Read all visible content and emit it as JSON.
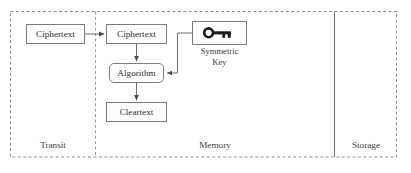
{
  "diagram": {
    "colors": {
      "background": "#ffffff",
      "zone_border": "#8e8e8e",
      "node_border": "#7a7a7a",
      "connector": "#6e6e6e",
      "text": "#2b2b2b",
      "key_glyph": "#1a1a1a"
    },
    "zones": [
      {
        "id": "transit",
        "label": "Transit",
        "divider_style": "dashed"
      },
      {
        "id": "memory",
        "label": "Memory",
        "divider_style": "solid"
      },
      {
        "id": "storage",
        "label": "Storage",
        "divider_style": "none"
      }
    ],
    "nodes": [
      {
        "id": "ciphertext-transit",
        "label": "Ciphertext",
        "shape": "rectangle",
        "zone": "transit"
      },
      {
        "id": "ciphertext-memory",
        "label": "Ciphertext",
        "shape": "rectangle",
        "zone": "memory"
      },
      {
        "id": "algorithm",
        "label": "Algorithm",
        "shape": "rounded-rectangle",
        "zone": "memory"
      },
      {
        "id": "cleartext",
        "label": "Cleartext",
        "shape": "rectangle",
        "zone": "memory"
      },
      {
        "id": "symmetric-key",
        "label": "",
        "shape": "rectangle",
        "zone": "memory",
        "icon": "key-icon"
      }
    ],
    "key_caption": {
      "line1": "Symmetric",
      "line2": "Key"
    },
    "connectors": [
      {
        "id": "transit-to-memory",
        "from": "ciphertext-transit",
        "to": "ciphertext-memory",
        "arrow": true
      },
      {
        "id": "ciphertext-to-algorithm",
        "from": "ciphertext-memory",
        "to": "algorithm",
        "arrow": true
      },
      {
        "id": "algorithm-to-cleartext",
        "from": "algorithm",
        "to": "cleartext",
        "arrow": true
      },
      {
        "id": "key-to-algorithm",
        "from": "symmetric-key",
        "to": "algorithm",
        "arrow": true
      }
    ]
  }
}
